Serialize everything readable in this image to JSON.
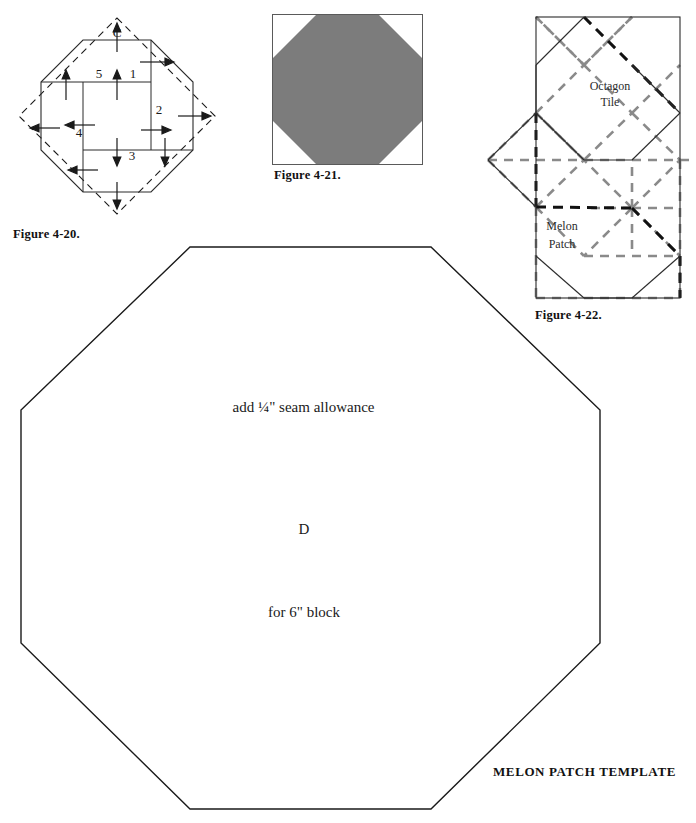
{
  "page": {
    "width": 696,
    "height": 823,
    "background": "#ffffff",
    "ink": "#1a1a1a"
  },
  "figures": [
    {
      "id": "figure-4-20",
      "caption": "Figure 4-20.",
      "description": "Pieced octagon block with numbered strips and pressing-direction arrows inside a dashed square",
      "corner_label": "C",
      "strip_numbers": [
        "1",
        "2",
        "3",
        "4",
        "5"
      ],
      "colors": {
        "solid_line": "#1a1a1a",
        "dashed_line": "#1a1a1a",
        "arrow": "#1a1a1a"
      }
    },
    {
      "id": "figure-4-21",
      "caption": "Figure 4-21.",
      "description": "Solid gray octagon inscribed in a square outline",
      "colors": {
        "fill": "#7c7c7c",
        "square_outline": "#5a5a5a"
      }
    },
    {
      "id": "figure-4-22",
      "caption": "Figure 4-22.",
      "description": "Tiling layout showing octagon tiles and melon patch units with dashed construction lines",
      "labels": [
        {
          "name": "octagon-tile-label",
          "line1": "Octagon",
          "line2": "Tile"
        },
        {
          "name": "melon-patch-label",
          "line1": "Melon",
          "line2": "Patch"
        }
      ],
      "colors": {
        "solid_line": "#2b2b2b",
        "gray_dash": "#8a8a8a",
        "black_dash": "#111111"
      }
    }
  ],
  "template": {
    "name": "melon-patch-template",
    "title": "MELON PATCH TEMPLATE",
    "seam_note": "add ¼\" seam allowance",
    "piece_letter": "D",
    "block_note": "for 6\" block",
    "outline_color": "#1a1a1a"
  }
}
